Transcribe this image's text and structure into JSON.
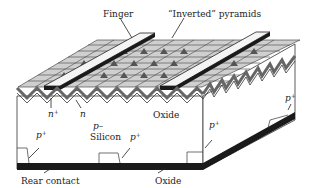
{
  "diagram": {
    "labels": {
      "finger": "Finger",
      "inverted_pyramids": "“Inverted” pyramids",
      "n_plus": "n",
      "n_plus_sup": "+",
      "n": "n",
      "oxide_top": "Oxide",
      "p_minus": "p–",
      "silicon": "Silicon",
      "p_plus_left": "p",
      "p_plus_mid": "p",
      "p_plus_right_front": "p",
      "p_plus_right_side": "p",
      "plus_sup": "+",
      "rear_contact": "Rear contact",
      "oxide_bottom": "Oxide"
    },
    "colors": {
      "background": "#ffffff",
      "metal": "#1a1a1a",
      "oxide_layer": "#8a8a8a",
      "pyramid_dark": "#555555",
      "pyramid_light": "#e8e8e8",
      "finger_top": "#f4f4f4",
      "silicon": "#ffffff"
    }
  }
}
